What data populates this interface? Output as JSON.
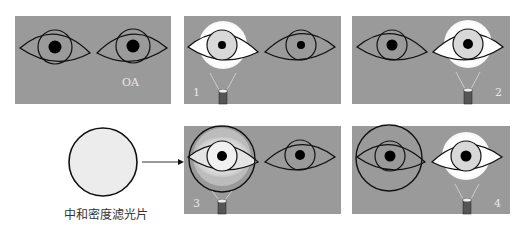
{
  "figure": {
    "panels": [
      {
        "id": "baseline",
        "label": "OA",
        "illuminated_eye": "none",
        "filter_eye": "none"
      },
      {
        "id": "step-1",
        "label": "1",
        "illuminated_eye": "right-of-subject-left-panel-eye",
        "filter_eye": "none"
      },
      {
        "id": "step-2",
        "label": "2",
        "illuminated_eye": "second",
        "filter_eye": "none"
      },
      {
        "id": "step-3",
        "label": "3",
        "illuminated_eye": "first",
        "filter_eye": "first"
      },
      {
        "id": "step-4",
        "label": "4",
        "illuminated_eye": "second",
        "filter_eye": "first"
      }
    ],
    "filter": {
      "caption": "中和密度滤光片"
    }
  },
  "colors": {
    "panel_bg": "#9a9a9a",
    "iris": "#9a9a9a",
    "lit_sclera": "#ffffff",
    "lit_iris": "#d8d8d8",
    "pupil": "#000000",
    "outline": "#111111",
    "filter_fill": "#ececec"
  }
}
